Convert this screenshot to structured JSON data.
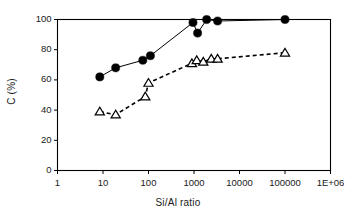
{
  "chart_data": {
    "type": "scatter",
    "title": "",
    "xlabel": "Si/Al ratio",
    "ylabel": "C (%)",
    "xscale": "log",
    "yscale": "linear",
    "xlim": [
      1,
      1000000
    ],
    "ylim": [
      0,
      100
    ],
    "grid": false,
    "legend": "none",
    "xticks": [
      1,
      10,
      100,
      1000,
      10000,
      100000,
      1000000
    ],
    "xticklabels": [
      "1",
      "10",
      "100",
      "1000",
      "10000",
      "100000",
      "1E+06"
    ],
    "yticks": [
      0,
      20,
      40,
      60,
      80,
      100
    ],
    "yticklabels": [
      "0",
      "20",
      "40",
      "60",
      "80",
      "100"
    ],
    "series": [
      {
        "name": "filled-circles",
        "marker": "filled-circle",
        "linestyle": "solid",
        "color": "#000000",
        "points": [
          {
            "x": 8.5,
            "y": 62
          },
          {
            "x": 19,
            "y": 68
          },
          {
            "x": 75,
            "y": 73
          },
          {
            "x": 110,
            "y": 76
          },
          {
            "x": 950,
            "y": 98
          },
          {
            "x": 1200,
            "y": 91
          },
          {
            "x": 1900,
            "y": 100
          },
          {
            "x": 3300,
            "y": 99
          },
          {
            "x": 100000,
            "y": 100
          }
        ]
      },
      {
        "name": "open-triangles",
        "marker": "open-triangle",
        "linestyle": "dashed",
        "color": "#000000",
        "points": [
          {
            "x": 8.5,
            "y": 39
          },
          {
            "x": 19,
            "y": 37
          },
          {
            "x": 85,
            "y": 49
          },
          {
            "x": 100,
            "y": 58
          },
          {
            "x": 900,
            "y": 71
          },
          {
            "x": 1150,
            "y": 73
          },
          {
            "x": 1600,
            "y": 72
          },
          {
            "x": 2400,
            "y": 74
          },
          {
            "x": 3300,
            "y": 74
          },
          {
            "x": 100000,
            "y": 78
          }
        ]
      }
    ]
  },
  "axes": {
    "frame_color": "#000000",
    "text_color": "#1a1a1a"
  }
}
